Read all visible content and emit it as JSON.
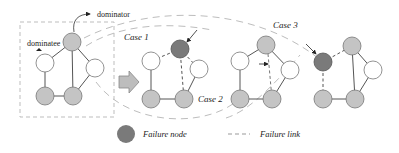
{
  "colors": {
    "normal_node": "#c4c4c4",
    "dominatee_node": "#ffffff",
    "failure_node": "#7a7a7a",
    "edge": "#555555",
    "dashed_frame": "#b8b8b8",
    "background": "#ffffff"
  },
  "labels": {
    "dominator": "dominator",
    "dominatee": "dominatee",
    "case1": "Case 1",
    "case2": "Case 2",
    "case3": "Case 3"
  },
  "legend": {
    "failure_node": "Failure node",
    "failure_link": "Failure link"
  },
  "graphs": [
    {
      "name": "original",
      "nodes": [
        {
          "id": "top",
          "x": 72,
          "y": 42,
          "type": "dominator"
        },
        {
          "id": "left",
          "x": 45,
          "y": 63,
          "type": "dominatee"
        },
        {
          "id": "right",
          "x": 95,
          "y": 68,
          "type": "dominatee"
        },
        {
          "id": "bl",
          "x": 45,
          "y": 96,
          "type": "dominator"
        },
        {
          "id": "br",
          "x": 73,
          "y": 96,
          "type": "dominator"
        }
      ]
    },
    {
      "name": "case1",
      "nodes": [
        {
          "id": "top",
          "x": 180,
          "y": 49,
          "type": "failure"
        },
        {
          "id": "left",
          "x": 151,
          "y": 61,
          "type": "dominatee"
        },
        {
          "id": "right",
          "x": 199,
          "y": 69,
          "type": "dominatee"
        },
        {
          "id": "bl",
          "x": 151,
          "y": 99,
          "type": "dominator"
        },
        {
          "id": "br",
          "x": 184,
          "y": 99,
          "type": "dominator"
        }
      ]
    },
    {
      "name": "case2",
      "nodes": [
        {
          "id": "top",
          "x": 266,
          "y": 45,
          "type": "dominator"
        },
        {
          "id": "left",
          "x": 240,
          "y": 61,
          "type": "dominatee"
        },
        {
          "id": "right",
          "x": 290,
          "y": 70,
          "type": "dominatee"
        },
        {
          "id": "bl",
          "x": 240,
          "y": 99,
          "type": "dominator"
        },
        {
          "id": "br",
          "x": 272,
          "y": 99,
          "type": "dominator"
        }
      ]
    },
    {
      "name": "case3",
      "nodes": [
        {
          "id": "left",
          "x": 323,
          "y": 62,
          "type": "failure"
        },
        {
          "id": "top",
          "x": 352,
          "y": 46,
          "type": "dominator"
        },
        {
          "id": "right",
          "x": 373,
          "y": 70,
          "type": "dominatee"
        },
        {
          "id": "bl",
          "x": 323,
          "y": 99,
          "type": "dominator"
        },
        {
          "id": "br",
          "x": 355,
          "y": 99,
          "type": "dominator"
        }
      ]
    }
  ]
}
